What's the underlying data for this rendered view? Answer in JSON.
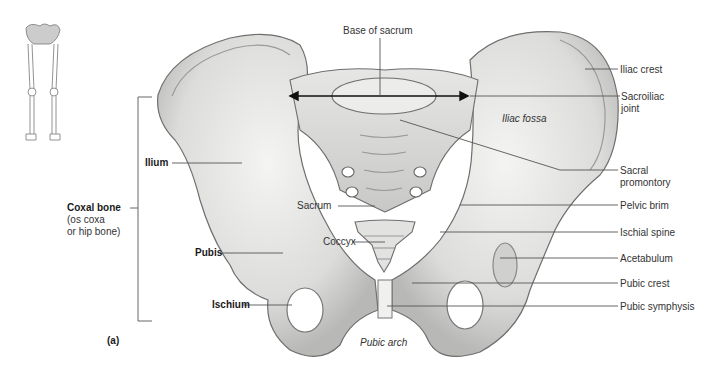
{
  "figure": {
    "panel_label": "(a)"
  },
  "labels": {
    "base_of_sacrum": "Base of sacrum",
    "iliac_crest": "Iliac crest",
    "sacroiliac_joint_line1": "Sacroiliac",
    "sacroiliac_joint_line2": "joint",
    "iliac_fossa": "Iliac fossa",
    "sacral_promontory_line1": "Sacral",
    "sacral_promontory_line2": "promontory",
    "pelvic_brim": "Pelvic brim",
    "ischial_spine": "Ischial spine",
    "acetabulum": "Acetabulum",
    "pubic_crest": "Pubic crest",
    "pubic_symphysis": "Pubic symphysis",
    "ilium": "Ilium",
    "coxal_bone": "Coxal bone",
    "coxal_bone_alt_line1": "(os coxa",
    "coxal_bone_alt_line2": "or hip bone)",
    "pubis": "Pubis",
    "ischium": "Ischium",
    "sacrum": "Sacrum",
    "coccyx": "Coccyx",
    "pubic_arch": "Pubic arch"
  },
  "colors": {
    "bone_fill": "#e8e8e6",
    "bone_shade": "#c4c4c2",
    "bone_outline": "#6e6e6e",
    "leader_line": "#555555",
    "text": "#2a2a2a"
  }
}
